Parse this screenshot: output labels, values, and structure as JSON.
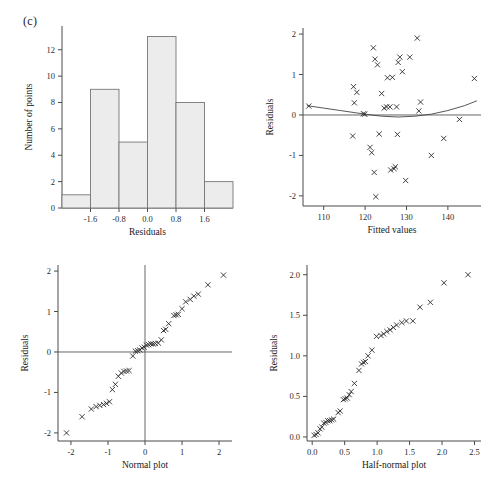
{
  "figure": {
    "panel_label": "(c)",
    "background": "#ffffff",
    "ink": "#222222",
    "bar_fill": "#ececec",
    "bar_stroke": "#777777"
  },
  "chart_data": [
    {
      "id": "histogram",
      "type": "bar",
      "title": "",
      "xlabel": "Residuals",
      "ylabel": "Number of points",
      "xlim": [
        -2.4,
        2.4
      ],
      "ylim": [
        0,
        13.8
      ],
      "xticks": [
        -1.6,
        -0.8,
        0.0,
        0.8,
        1.6
      ],
      "xticklabels": [
        "-1.6",
        "-0.8",
        "0.0",
        "0.8",
        "1.6"
      ],
      "yticks": [
        0,
        2,
        4,
        6,
        8,
        10,
        12
      ],
      "yticklabels": [
        "0",
        "2",
        "4",
        "6",
        "8",
        "10",
        "12"
      ],
      "grid": false,
      "legend": "none",
      "bin_edges": [
        -2.4,
        -1.6,
        -0.8,
        0.0,
        0.8,
        1.6,
        2.4
      ],
      "categories": [
        "-2.4 to -1.6",
        "-1.6 to -0.8",
        "-0.8 to 0.0",
        "0.0 to 0.8",
        "0.8 to 1.6",
        "1.6 to 2.4"
      ],
      "values": [
        1,
        9,
        5,
        13,
        8,
        2
      ]
    },
    {
      "id": "residuals-vs-fitted",
      "type": "scatter",
      "title": "",
      "xlabel": "Fitted values",
      "ylabel": "Residuals",
      "xlim": [
        105,
        148
      ],
      "ylim": [
        -2.25,
        2.15
      ],
      "xticks": [
        110,
        120,
        130,
        140
      ],
      "xticklabels": [
        "110",
        "120",
        "130",
        "140"
      ],
      "yticks": [
        -2,
        -1,
        0,
        1,
        2
      ],
      "yticklabels": [
        "-2",
        "-1",
        "0",
        "1",
        "2"
      ],
      "grid": false,
      "legend": "none",
      "marker": "x",
      "reference_line_y": 0,
      "points": [
        [
          106.4,
          0.22
        ],
        [
          117.0,
          -0.52
        ],
        [
          117.2,
          0.7
        ],
        [
          117.4,
          0.3
        ],
        [
          118.0,
          0.56
        ],
        [
          119.6,
          0.03
        ],
        [
          119.9,
          0.02
        ],
        [
          121.2,
          -0.8
        ],
        [
          121.6,
          -0.93
        ],
        [
          122.0,
          1.66
        ],
        [
          122.2,
          -1.42
        ],
        [
          122.4,
          1.38
        ],
        [
          122.6,
          -2.02
        ],
        [
          123.0,
          1.24
        ],
        [
          123.4,
          -0.47
        ],
        [
          124.0,
          0.53
        ],
        [
          124.6,
          0.17
        ],
        [
          125.2,
          0.2
        ],
        [
          125.4,
          0.92
        ],
        [
          126.0,
          0.2
        ],
        [
          126.2,
          -1.36
        ],
        [
          126.6,
          0.93
        ],
        [
          127.0,
          -1.33
        ],
        [
          127.3,
          -1.28
        ],
        [
          127.6,
          0.2
        ],
        [
          127.8,
          -0.48
        ],
        [
          128.0,
          1.3
        ],
        [
          128.4,
          1.43
        ],
        [
          129.0,
          1.07
        ],
        [
          129.8,
          -1.62
        ],
        [
          130.8,
          1.43
        ],
        [
          132.6,
          1.9
        ],
        [
          133.0,
          0.1
        ],
        [
          133.4,
          0.32
        ],
        [
          136.0,
          -1.0
        ],
        [
          139.0,
          -0.58
        ],
        [
          142.8,
          -0.11
        ],
        [
          146.4,
          0.9
        ]
      ],
      "smooth_curve": [
        [
          106.0,
          0.23
        ],
        [
          110.0,
          0.17
        ],
        [
          114.0,
          0.11
        ],
        [
          118.0,
          0.05
        ],
        [
          120.0,
          0.02
        ],
        [
          124.0,
          -0.03
        ],
        [
          128.0,
          -0.05
        ],
        [
          132.0,
          -0.03
        ],
        [
          136.0,
          0.02
        ],
        [
          140.0,
          0.11
        ],
        [
          144.0,
          0.23
        ],
        [
          147.0,
          0.35
        ]
      ]
    },
    {
      "id": "normal-plot",
      "type": "scatter",
      "title": "",
      "xlabel": "Normal plot",
      "ylabel": "Residuals",
      "xlim": [
        -2.35,
        2.35
      ],
      "ylim": [
        -2.2,
        2.15
      ],
      "xticks": [
        -2,
        -1,
        0,
        1,
        2
      ],
      "xticklabels": [
        "-2",
        "-1",
        "0",
        "1",
        "2"
      ],
      "yticks": [
        -2,
        -1,
        0,
        1,
        2
      ],
      "yticklabels": [
        "-2",
        "-1",
        "0",
        "1",
        "2"
      ],
      "grid": false,
      "legend": "none",
      "marker": "x",
      "reference_line_y": 0,
      "reference_line_x": 0,
      "points": [
        [
          -2.12,
          -2.0
        ],
        [
          -1.7,
          -1.6
        ],
        [
          -1.45,
          -1.41
        ],
        [
          -1.32,
          -1.35
        ],
        [
          -1.22,
          -1.32
        ],
        [
          -1.12,
          -1.3
        ],
        [
          -1.04,
          -1.27
        ],
        [
          -0.96,
          -1.23
        ],
        [
          -0.88,
          -0.93
        ],
        [
          -0.8,
          -0.8
        ],
        [
          -0.72,
          -0.6
        ],
        [
          -0.64,
          -0.52
        ],
        [
          -0.57,
          -0.48
        ],
        [
          -0.5,
          -0.47
        ],
        [
          -0.43,
          -0.46
        ],
        [
          -0.33,
          -0.1
        ],
        [
          -0.26,
          0.02
        ],
        [
          -0.2,
          0.03
        ],
        [
          -0.14,
          0.05
        ],
        [
          -0.08,
          0.1
        ],
        [
          -0.02,
          0.12
        ],
        [
          0.04,
          0.17
        ],
        [
          0.1,
          0.18
        ],
        [
          0.16,
          0.2
        ],
        [
          0.22,
          0.2
        ],
        [
          0.28,
          0.21
        ],
        [
          0.36,
          0.22
        ],
        [
          0.44,
          0.3
        ],
        [
          0.5,
          0.53
        ],
        [
          0.56,
          0.56
        ],
        [
          0.64,
          0.7
        ],
        [
          0.78,
          0.9
        ],
        [
          0.84,
          0.92
        ],
        [
          0.9,
          0.93
        ],
        [
          1.0,
          1.07
        ],
        [
          1.1,
          1.24
        ],
        [
          1.22,
          1.3
        ],
        [
          1.32,
          1.38
        ],
        [
          1.44,
          1.43
        ],
        [
          1.7,
          1.66
        ],
        [
          2.12,
          1.9
        ]
      ]
    },
    {
      "id": "half-normal-plot",
      "type": "scatter",
      "title": "",
      "xlabel": "Half-normal plot",
      "ylabel": "Residuals",
      "xlim": [
        -0.08,
        2.6
      ],
      "ylim": [
        -0.05,
        2.12
      ],
      "xticks": [
        0.0,
        0.5,
        1.0,
        1.5,
        2.0,
        2.5
      ],
      "xticklabels": [
        "0.0",
        "0.5",
        "1.0",
        "1.5",
        "2.0",
        "2.5"
      ],
      "yticks": [
        0.0,
        0.5,
        1.0,
        1.5,
        2.0
      ],
      "yticklabels": [
        "0.0",
        "0.5",
        "1.0",
        "1.5",
        "2.0"
      ],
      "grid": false,
      "legend": "none",
      "marker": "x",
      "points": [
        [
          0.03,
          0.02
        ],
        [
          0.06,
          0.03
        ],
        [
          0.09,
          0.05
        ],
        [
          0.12,
          0.1
        ],
        [
          0.15,
          0.12
        ],
        [
          0.18,
          0.17
        ],
        [
          0.21,
          0.18
        ],
        [
          0.24,
          0.2
        ],
        [
          0.27,
          0.2
        ],
        [
          0.3,
          0.21
        ],
        [
          0.33,
          0.22
        ],
        [
          0.4,
          0.3
        ],
        [
          0.43,
          0.32
        ],
        [
          0.48,
          0.46
        ],
        [
          0.51,
          0.47
        ],
        [
          0.54,
          0.48
        ],
        [
          0.57,
          0.52
        ],
        [
          0.6,
          0.56
        ],
        [
          0.65,
          0.66
        ],
        [
          0.72,
          0.82
        ],
        [
          0.76,
          0.9
        ],
        [
          0.79,
          0.92
        ],
        [
          0.82,
          0.93
        ],
        [
          0.86,
          1.0
        ],
        [
          0.92,
          1.07
        ],
        [
          0.99,
          1.24
        ],
        [
          1.06,
          1.25
        ],
        [
          1.1,
          1.27
        ],
        [
          1.15,
          1.3
        ],
        [
          1.2,
          1.32
        ],
        [
          1.25,
          1.35
        ],
        [
          1.3,
          1.38
        ],
        [
          1.38,
          1.41
        ],
        [
          1.45,
          1.43
        ],
        [
          1.55,
          1.43
        ],
        [
          1.66,
          1.6
        ],
        [
          1.82,
          1.66
        ],
        [
          2.03,
          1.9
        ],
        [
          2.4,
          2.0
        ]
      ]
    }
  ]
}
